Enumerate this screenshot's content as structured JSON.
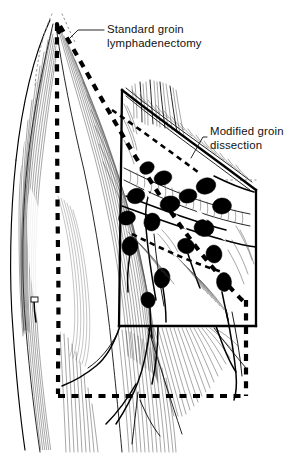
{
  "figure": {
    "background_color": "#ffffff",
    "ink_color": "#000000",
    "width": 300,
    "height": 457
  },
  "annotations": [
    {
      "id": "standard-groin",
      "line1": "Standard groin",
      "line2": "lymphadenectomy",
      "boundary_style": "dashed",
      "text_x": 107,
      "text_y": 32,
      "leader": "M 70,30 L 94,30 L 103,30"
    },
    {
      "id": "modified-groin",
      "line1": "Modified groin",
      "line2": "dissection",
      "boundary_style": "solid",
      "text_x": 210,
      "text_y": 134,
      "leader": "M 193,156 L 204,140 L 208,137"
    }
  ],
  "boundaries": {
    "standard": {
      "label": "Standard groin lymphadenectomy",
      "style": "dashed",
      "stroke_width": 4.2,
      "region": "large dashed polygon spanning upper thigh apex to lower right"
    },
    "modified": {
      "label": "Modified groin dissection",
      "style": "solid",
      "stroke_width": 2.3,
      "region": "smaller solid quadrilateral with curved superior border"
    }
  },
  "anatomy": {
    "structures": [
      "thigh musculature",
      "inguinal lymph nodes",
      "femoral vessels",
      "saphenous vein",
      "fascia lata"
    ],
    "lymph_node_count": 14
  }
}
